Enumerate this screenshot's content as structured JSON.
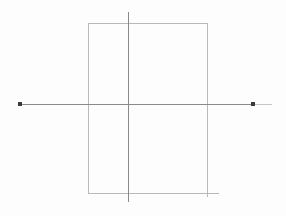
{
  "canvas": {
    "width": 286,
    "height": 216,
    "background_color": "#fdfdfd",
    "title": "Geometric line drawing"
  },
  "palette": {
    "rectangle_stroke": "#b9b9b9",
    "axis_stroke": "#8a8a8a",
    "axis_stroke_faint": "#c6c6c6",
    "marker_fill": "#3a3a3a"
  },
  "chart_data": {
    "type": "scatter",
    "title": "",
    "subtitle": "",
    "xlabel": "",
    "ylabel": "",
    "grid": false,
    "legend": null,
    "annotations": [],
    "tick_labels": {
      "x": [],
      "y": []
    },
    "xlim": [
      0,
      286
    ],
    "ylim": [
      0,
      216
    ],
    "points": [
      {
        "name": "left-endpoint",
        "x": 19,
        "y": 104
      },
      {
        "name": "right-endpoint",
        "x": 253,
        "y": 104
      }
    ]
  },
  "figure": {
    "shapes": [
      {
        "id": "rect-top-edge",
        "name": "rectangle-top-edge",
        "kind": "line",
        "x1": 88,
        "y1": 23.5,
        "x2": 208,
        "y2": 23.5,
        "stroke": "#b9b9b9",
        "width": 1
      },
      {
        "id": "rect-left-edge",
        "name": "rectangle-left-edge",
        "kind": "line",
        "x1": 88.5,
        "y1": 23,
        "x2": 88.5,
        "y2": 194,
        "stroke": "#b9b9b9",
        "width": 1
      },
      {
        "id": "rect-right-edge",
        "name": "rectangle-right-edge",
        "kind": "line",
        "x1": 207.5,
        "y1": 23,
        "x2": 207.5,
        "y2": 197,
        "stroke": "#b9b9b9",
        "width": 1
      },
      {
        "id": "rect-bottom-edge",
        "name": "rectangle-bottom-edge",
        "kind": "line",
        "x1": 88,
        "y1": 193.5,
        "x2": 219,
        "y2": 193.5,
        "stroke": "#b9b9b9",
        "width": 1
      },
      {
        "id": "vertical-axis",
        "name": "vertical-axis-line",
        "kind": "line",
        "x1": 128.5,
        "y1": 12,
        "x2": 128.5,
        "y2": 202,
        "stroke": "#8a8a8a",
        "width": 1
      },
      {
        "id": "horizontal-axis",
        "name": "horizontal-axis-line",
        "kind": "line",
        "x1": 18,
        "y1": 104.5,
        "x2": 254,
        "y2": 104.5,
        "stroke": "#8a8a8a",
        "width": 1
      },
      {
        "id": "horizontal-axis-tail",
        "name": "horizontal-axis-tail",
        "kind": "line",
        "x1": 254,
        "y1": 104.5,
        "x2": 272,
        "y2": 104.5,
        "stroke": "#c6c6c6",
        "width": 1
      }
    ],
    "markers": [
      {
        "id": "marker-left",
        "name": "left-point-marker",
        "x": 18,
        "y": 102,
        "size": 4,
        "fill": "#3a3a3a"
      },
      {
        "id": "marker-right",
        "name": "right-point-marker",
        "x": 251,
        "y": 102,
        "size": 4,
        "fill": "#3a3a3a"
      }
    ]
  }
}
